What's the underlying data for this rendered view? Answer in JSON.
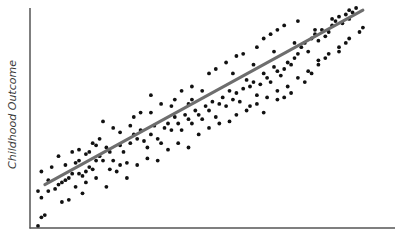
{
  "chart_data": {
    "type": "scatter",
    "title": "",
    "xlabel": "",
    "ylabel": "Childhood Outcome",
    "grid": false,
    "legend": null,
    "axis_ticks": "none",
    "xlim": [
      0,
      100
    ],
    "ylim": [
      0,
      100
    ],
    "trendline": {
      "type": "linear",
      "x": [
        2,
        95
      ],
      "y": [
        19,
        99
      ],
      "color": "#6e6e6e"
    },
    "point_color": "#111111",
    "points": [
      [
        0,
        0
      ],
      [
        1,
        4
      ],
      [
        2,
        5
      ],
      [
        0,
        16
      ],
      [
        3,
        16
      ],
      [
        1,
        13
      ],
      [
        1,
        25
      ],
      [
        3,
        21
      ],
      [
        5,
        17
      ],
      [
        6,
        19
      ],
      [
        7,
        20
      ],
      [
        8,
        21
      ],
      [
        9,
        22
      ],
      [
        7,
        11
      ],
      [
        9,
        12
      ],
      [
        11,
        18
      ],
      [
        13,
        15
      ],
      [
        10,
        24
      ],
      [
        12,
        24
      ],
      [
        13,
        23
      ],
      [
        11,
        29
      ],
      [
        12,
        30
      ],
      [
        14,
        25
      ],
      [
        15,
        27
      ],
      [
        16,
        26
      ],
      [
        14,
        33
      ],
      [
        15,
        34
      ],
      [
        17,
        30
      ],
      [
        18,
        32
      ],
      [
        19,
        30
      ],
      [
        17,
        37
      ],
      [
        20,
        36
      ],
      [
        21,
        34
      ],
      [
        22,
        30
      ],
      [
        19,
        48
      ],
      [
        21,
        26
      ],
      [
        24,
        37
      ],
      [
        25,
        34
      ],
      [
        27,
        38
      ],
      [
        24,
        43
      ],
      [
        28,
        42
      ],
      [
        29,
        40
      ],
      [
        30,
        44
      ],
      [
        26,
        29
      ],
      [
        31,
        39
      ],
      [
        32,
        36
      ],
      [
        33,
        42
      ],
      [
        34,
        46
      ],
      [
        33,
        52
      ],
      [
        35,
        40
      ],
      [
        36,
        38
      ],
      [
        37,
        45
      ],
      [
        38,
        47
      ],
      [
        39,
        44
      ],
      [
        40,
        50
      ],
      [
        41,
        47
      ],
      [
        42,
        44
      ],
      [
        43,
        51
      ],
      [
        44,
        49
      ],
      [
        45,
        47
      ],
      [
        44,
        56
      ],
      [
        46,
        53
      ],
      [
        47,
        51
      ],
      [
        48,
        49
      ],
      [
        49,
        55
      ],
      [
        50,
        53
      ],
      [
        51,
        57
      ],
      [
        52,
        50
      ],
      [
        53,
        56
      ],
      [
        54,
        59
      ],
      [
        55,
        55
      ],
      [
        56,
        62
      ],
      [
        57,
        58
      ],
      [
        58,
        61
      ],
      [
        59,
        57
      ],
      [
        60,
        63
      ],
      [
        61,
        67
      ],
      [
        62,
        64
      ],
      [
        63,
        66
      ],
      [
        64,
        60
      ],
      [
        65,
        65
      ],
      [
        66,
        70
      ],
      [
        67,
        68
      ],
      [
        68,
        66
      ],
      [
        69,
        73
      ],
      [
        70,
        71
      ],
      [
        71,
        69
      ],
      [
        72,
        72
      ],
      [
        73,
        75
      ],
      [
        74,
        74
      ],
      [
        75,
        77
      ],
      [
        76,
        79
      ],
      [
        77,
        82
      ],
      [
        78,
        84
      ],
      [
        79,
        80
      ],
      [
        80,
        86
      ],
      [
        81,
        88
      ],
      [
        82,
        85
      ],
      [
        83,
        90
      ],
      [
        84,
        87
      ],
      [
        85,
        89
      ],
      [
        86,
        92
      ],
      [
        87,
        94
      ],
      [
        88,
        96
      ],
      [
        89,
        93
      ],
      [
        90,
        97
      ],
      [
        91,
        95
      ],
      [
        92,
        98
      ],
      [
        93,
        100
      ],
      [
        94,
        89
      ],
      [
        95,
        91
      ],
      [
        62,
        55
      ],
      [
        66,
        52
      ],
      [
        70,
        58
      ],
      [
        72,
        59
      ],
      [
        74,
        61
      ],
      [
        78,
        66
      ],
      [
        80,
        70
      ],
      [
        82,
        74
      ],
      [
        84,
        77
      ],
      [
        88,
        80
      ],
      [
        90,
        84
      ],
      [
        50,
        70
      ],
      [
        52,
        72
      ],
      [
        55,
        75
      ],
      [
        58,
        78
      ],
      [
        60,
        79
      ],
      [
        64,
        82
      ],
      [
        66,
        86
      ],
      [
        68,
        88
      ],
      [
        70,
        90
      ],
      [
        72,
        92
      ],
      [
        76,
        94
      ],
      [
        40,
        58
      ],
      [
        42,
        62
      ],
      [
        45,
        64
      ],
      [
        36,
        56
      ],
      [
        30,
        52
      ],
      [
        28,
        50
      ],
      [
        22,
        45
      ],
      [
        18,
        40
      ],
      [
        16,
        38
      ],
      [
        10,
        34
      ],
      [
        8,
        28
      ],
      [
        6,
        32
      ],
      [
        4,
        27
      ],
      [
        14,
        20
      ],
      [
        17,
        22
      ],
      [
        20,
        18
      ],
      [
        23,
        25
      ],
      [
        26,
        22
      ],
      [
        29,
        28
      ],
      [
        32,
        31
      ],
      [
        35,
        30
      ],
      [
        38,
        35
      ],
      [
        41,
        38
      ],
      [
        44,
        36
      ],
      [
        47,
        42
      ],
      [
        50,
        45
      ],
      [
        53,
        47
      ],
      [
        56,
        48
      ],
      [
        58,
        51
      ],
      [
        61,
        53
      ],
      [
        64,
        56
      ],
      [
        67,
        59
      ],
      [
        70,
        62
      ],
      [
        73,
        64
      ],
      [
        76,
        68
      ],
      [
        79,
        71
      ],
      [
        82,
        76
      ],
      [
        85,
        79
      ],
      [
        88,
        82
      ],
      [
        91,
        86
      ],
      [
        33,
        60
      ],
      [
        27,
        46
      ],
      [
        57,
        70
      ],
      [
        63,
        74
      ],
      [
        69,
        80
      ],
      [
        75,
        84
      ],
      [
        81,
        90
      ],
      [
        86,
        95
      ],
      [
        91,
        99
      ],
      [
        45,
        58
      ],
      [
        48,
        62
      ],
      [
        39,
        55
      ],
      [
        24,
        28
      ],
      [
        12,
        35
      ]
    ]
  }
}
